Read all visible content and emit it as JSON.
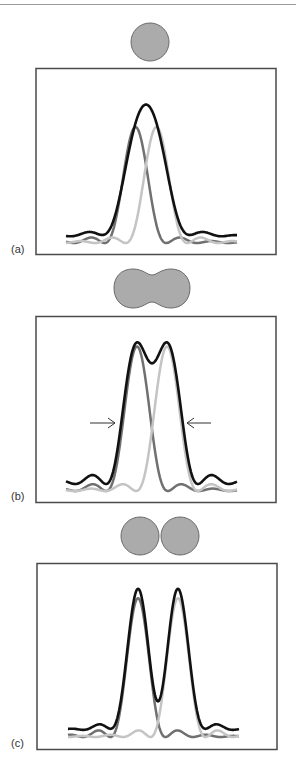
{
  "figure": {
    "colors": {
      "sum_curve": "#111111",
      "source_left": "#707070",
      "source_right": "#c4c4c4",
      "object_fill": "#ababab",
      "object_stroke": "#6a6a6a",
      "frame": "#4a4a4a",
      "arrow": "#333333",
      "rule": "#9a9a9a"
    },
    "panels": [
      {
        "label": "(a)",
        "object": "single-disc",
        "state": "unresolved",
        "separation_px": 21,
        "sum_peak_count": 1
      },
      {
        "label": "(b)",
        "object": "merged-peanut",
        "state": "just resolved",
        "separation_px": 30,
        "sum_peak_count": 2,
        "arrows": [
          "right-arrow",
          "left-arrow"
        ]
      },
      {
        "label": "(c)",
        "object": "two-discs",
        "state": "well resolved",
        "separation_px": 40,
        "sum_peak_count": 2
      }
    ]
  }
}
